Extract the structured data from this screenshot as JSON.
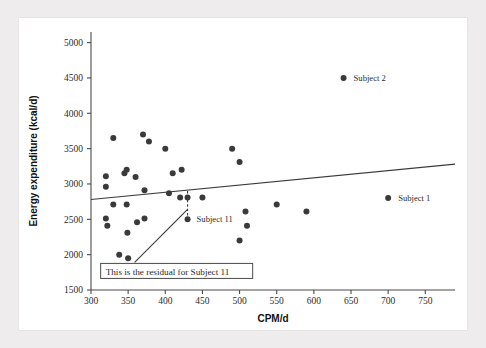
{
  "figure": {
    "background_color": "#eeecec",
    "plate_color": "#ffffff",
    "ink_color": "#3a3a3a"
  },
  "chart_data": {
    "type": "scatter",
    "title": "",
    "xlabel": "CPM/d",
    "ylabel": "Energy expenditure (kcal/d)",
    "xlim": [
      300,
      790
    ],
    "ylim": [
      1500,
      5150
    ],
    "xticks": [
      300,
      350,
      400,
      450,
      500,
      550,
      600,
      650,
      700,
      750
    ],
    "xticklabels": [
      "300",
      "350",
      "400",
      "450",
      "500",
      "550",
      "600",
      "650",
      "700",
      "750"
    ],
    "yticks": [
      1500,
      2000,
      2500,
      3000,
      3500,
      4000,
      4500,
      5000
    ],
    "yticklabels": [
      "1500",
      "2000",
      "2500",
      "3000",
      "3500",
      "4000",
      "4500",
      "5000"
    ],
    "grid": false,
    "legend": false,
    "marker_color": "#3a3a3a",
    "marker_size": 3.0,
    "points": [
      {
        "x": 320,
        "y": 2960
      },
      {
        "x": 320,
        "y": 3110
      },
      {
        "x": 320,
        "y": 2510
      },
      {
        "x": 322,
        "y": 2410
      },
      {
        "x": 330,
        "y": 3650
      },
      {
        "x": 330,
        "y": 2710
      },
      {
        "x": 338,
        "y": 2000
      },
      {
        "x": 345,
        "y": 3150
      },
      {
        "x": 348,
        "y": 3200
      },
      {
        "x": 348,
        "y": 2710
      },
      {
        "x": 349,
        "y": 2310
      },
      {
        "x": 350,
        "y": 1950
      },
      {
        "x": 360,
        "y": 3100
      },
      {
        "x": 362,
        "y": 2460
      },
      {
        "x": 370,
        "y": 3700
      },
      {
        "x": 372,
        "y": 2910
      },
      {
        "x": 372,
        "y": 2510
      },
      {
        "x": 378,
        "y": 3600
      },
      {
        "x": 400,
        "y": 3500
      },
      {
        "x": 405,
        "y": 2870
      },
      {
        "x": 410,
        "y": 3150
      },
      {
        "x": 420,
        "y": 2810
      },
      {
        "x": 422,
        "y": 3200
      },
      {
        "x": 430,
        "y": 2810
      },
      {
        "x": 450,
        "y": 2810
      },
      {
        "x": 490,
        "y": 3500
      },
      {
        "x": 500,
        "y": 3310
      },
      {
        "x": 500,
        "y": 2200
      },
      {
        "x": 508,
        "y": 2610
      },
      {
        "x": 510,
        "y": 2410
      },
      {
        "x": 550,
        "y": 2710
      },
      {
        "x": 590,
        "y": 2610
      }
    ],
    "highlighted_points": [
      {
        "label": "Subject 2",
        "x": 640,
        "y": 4500,
        "label_dx": 10,
        "label_dy": 3
      },
      {
        "label": "Subject 1",
        "x": 700,
        "y": 2800,
        "label_dx": 10,
        "label_dy": 3
      },
      {
        "label": "Subject 11",
        "x": 430,
        "y": 2500,
        "label_dx": 9,
        "label_dy": 3
      }
    ],
    "regression_line": {
      "x_start": 300,
      "y_start": 2780,
      "x_end": 790,
      "y_end": 3280,
      "color": "#3a3a3a"
    },
    "residual_segment": {
      "note": "dashed vertical residual for Subject 11",
      "x": 430,
      "y_top": 2900,
      "y_bottom": 2500,
      "style": "dashed"
    },
    "annotations": [
      {
        "name": "residual-callout",
        "text": "This is the residual for Subject 11",
        "box_x": 313,
        "box_y": 1770,
        "pointer_to_x": 430,
        "pointer_to_y": 2640
      }
    ]
  },
  "labels": {
    "subject_1": "Subject 1",
    "subject_2": "Subject 2",
    "subject_11": "Subject 11",
    "callout": "This is the residual for Subject 11",
    "x_axis_title": "CPM/d",
    "y_axis_title": "Energy expenditure (kcal/d)"
  }
}
